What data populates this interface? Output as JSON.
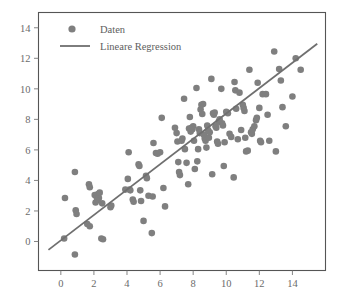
{
  "chart_data": {
    "type": "scatter",
    "title": "",
    "xlabel": "",
    "ylabel": "",
    "xlim": [
      -1.35,
      16.0
    ],
    "ylim": [
      -1.9,
      15.0
    ],
    "xticks": [
      0,
      2,
      4,
      6,
      8,
      10,
      12,
      14
    ],
    "yticks": [
      0,
      2,
      4,
      6,
      8,
      10,
      12,
      14
    ],
    "grid": false,
    "legend_position": "upper-left",
    "marker_color": "#7f7f7f",
    "line_color": "#6f6f6f",
    "frame_color": "#555555",
    "background": "#ffffff",
    "series": [
      {
        "name": "Daten",
        "type": "scatter",
        "marker": "circle",
        "color": "#7f7f7f",
        "points": [
          [
            0.25,
            2.85
          ],
          [
            0.2,
            0.2
          ],
          [
            0.85,
            4.55
          ],
          [
            0.9,
            2.05
          ],
          [
            0.95,
            1.8
          ],
          [
            0.85,
            -0.85
          ],
          [
            1.7,
            3.75
          ],
          [
            1.75,
            3.55
          ],
          [
            1.6,
            1.15
          ],
          [
            1.75,
            1.0
          ],
          [
            2.05,
            3.05
          ],
          [
            2.15,
            2.95
          ],
          [
            2.25,
            3.1
          ],
          [
            2.3,
            2.85
          ],
          [
            2.2,
            2.7
          ],
          [
            2.35,
            3.2
          ],
          [
            2.1,
            2.55
          ],
          [
            2.45,
            0.2
          ],
          [
            2.5,
            2.5
          ],
          [
            2.55,
            0.15
          ],
          [
            3.0,
            2.25
          ],
          [
            3.05,
            2.35
          ],
          [
            4.05,
            4.1
          ],
          [
            4.1,
            5.85
          ],
          [
            4.15,
            3.4
          ],
          [
            4.2,
            3.35
          ],
          [
            4.35,
            2.75
          ],
          [
            4.4,
            2.6
          ],
          [
            4.7,
            5.05
          ],
          [
            4.75,
            4.95
          ],
          [
            4.8,
            3.35
          ],
          [
            4.85,
            2.65
          ],
          [
            5.0,
            1.35
          ],
          [
            5.15,
            4.3
          ],
          [
            5.2,
            4.15
          ],
          [
            5.3,
            3.0
          ],
          [
            5.5,
            0.55
          ],
          [
            5.55,
            2.95
          ],
          [
            5.6,
            6.45
          ],
          [
            5.75,
            5.8
          ],
          [
            5.85,
            5.75
          ],
          [
            6.1,
            8.1
          ],
          [
            6.2,
            3.5
          ],
          [
            6.3,
            2.3
          ],
          [
            6.9,
            7.45
          ],
          [
            7.0,
            7.1
          ],
          [
            7.05,
            6.55
          ],
          [
            7.1,
            5.2
          ],
          [
            7.15,
            4.55
          ],
          [
            7.2,
            4.35
          ],
          [
            7.3,
            6.6
          ],
          [
            7.35,
            6.75
          ],
          [
            7.45,
            9.35
          ],
          [
            7.5,
            6.05
          ],
          [
            7.6,
            5.15
          ],
          [
            7.7,
            3.75
          ],
          [
            7.8,
            8.15
          ],
          [
            7.85,
            7.2
          ],
          [
            7.9,
            7.45
          ],
          [
            7.95,
            7.35
          ],
          [
            8.0,
            7.55
          ],
          [
            8.05,
            6.6
          ],
          [
            8.1,
            4.75
          ],
          [
            8.2,
            10.05
          ],
          [
            8.25,
            5.25
          ],
          [
            8.35,
            7.35
          ],
          [
            8.4,
            7.1
          ],
          [
            8.45,
            8.65
          ],
          [
            8.5,
            8.95
          ],
          [
            8.55,
            8.35
          ],
          [
            8.6,
            9.0
          ],
          [
            8.65,
            7.0
          ],
          [
            8.7,
            6.75
          ],
          [
            8.75,
            6.6
          ],
          [
            8.8,
            6.15
          ],
          [
            8.85,
            7.6
          ],
          [
            8.9,
            7.3
          ],
          [
            8.95,
            6.8
          ],
          [
            9.0,
            7.15
          ],
          [
            9.1,
            10.65
          ],
          [
            9.15,
            4.4
          ],
          [
            9.2,
            8.4
          ],
          [
            9.25,
            8.3
          ],
          [
            9.3,
            8.45
          ],
          [
            9.35,
            7.55
          ],
          [
            9.4,
            7.45
          ],
          [
            9.45,
            6.55
          ],
          [
            9.5,
            6.4
          ],
          [
            9.55,
            7.85
          ],
          [
            9.6,
            8.0
          ],
          [
            9.7,
            10.0
          ],
          [
            9.75,
            7.75
          ],
          [
            9.8,
            7.6
          ],
          [
            9.85,
            4.95
          ],
          [
            10.0,
            8.5
          ],
          [
            10.1,
            8.4
          ],
          [
            10.2,
            7.05
          ],
          [
            10.3,
            6.85
          ],
          [
            10.45,
            4.2
          ],
          [
            10.5,
            10.45
          ],
          [
            10.55,
            9.9
          ],
          [
            10.6,
            8.7
          ],
          [
            10.7,
            6.7
          ],
          [
            10.9,
            7.3
          ],
          [
            11.0,
            8.95
          ],
          [
            11.05,
            8.75
          ],
          [
            11.1,
            8.55
          ],
          [
            11.15,
            6.8
          ],
          [
            11.2,
            5.9
          ],
          [
            11.3,
            5.95
          ],
          [
            11.4,
            11.25
          ],
          [
            11.5,
            7.15
          ],
          [
            11.55,
            7.05
          ],
          [
            11.6,
            7.35
          ],
          [
            11.7,
            7.55
          ],
          [
            11.8,
            7.95
          ],
          [
            11.85,
            8.1
          ],
          [
            11.9,
            10.4
          ],
          [
            12.0,
            8.75
          ],
          [
            12.05,
            6.6
          ],
          [
            12.1,
            6.5
          ],
          [
            12.2,
            9.65
          ],
          [
            12.4,
            9.65
          ],
          [
            12.5,
            8.3
          ],
          [
            12.9,
            12.45
          ],
          [
            13.0,
            5.9
          ],
          [
            13.2,
            11.3
          ],
          [
            13.3,
            10.55
          ],
          [
            13.4,
            8.8
          ],
          [
            13.6,
            7.55
          ],
          [
            14.0,
            9.5
          ],
          [
            14.2,
            12.0
          ],
          [
            14.5,
            11.25
          ],
          [
            6.0,
            5.85
          ],
          [
            3.9,
            3.4
          ],
          [
            12.6,
            6.6
          ],
          [
            10.8,
            9.75
          ],
          [
            9.9,
            6.5
          ],
          [
            8.3,
            6.05
          ],
          [
            7.75,
            7.4
          ]
        ]
      },
      {
        "name": "Lineare Regression",
        "type": "line",
        "color": "#6f6f6f",
        "x_endpoints": [
          -0.75,
          15.5
        ],
        "y_endpoints": [
          -0.55,
          12.95
        ],
        "slope": 0.8308,
        "intercept": 0.0731
      }
    ]
  },
  "legend": {
    "items": [
      {
        "label": "Daten",
        "marker": "circle-marker-icon",
        "color": "#7f7f7f"
      },
      {
        "label": "Lineare Regression",
        "marker": "line-marker-icon",
        "color": "#6f6f6f"
      }
    ]
  }
}
